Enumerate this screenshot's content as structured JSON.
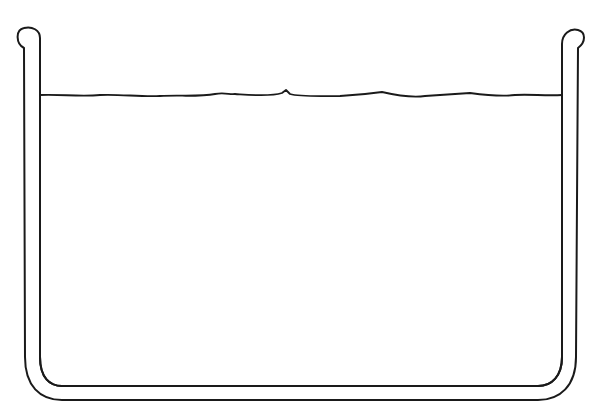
{
  "diagram": {
    "stroke_color": "#1a1a1a",
    "background": "#ffffff",
    "cropped_text": "..."
  }
}
